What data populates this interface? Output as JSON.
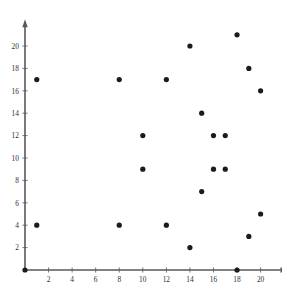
{
  "chart_data": {
    "type": "scatter",
    "title": "",
    "subtitle": "",
    "xlabel": "",
    "ylabel": "",
    "xlim": [
      0,
      22.2
    ],
    "ylim": [
      0,
      22.2
    ],
    "grid": false,
    "legend": null,
    "marker": {
      "shape": "circle",
      "color": "#1b1b1e",
      "radius_px": 2.6
    },
    "axis_color": "#58585a",
    "background_color": "#ffffff",
    "xticks": [
      2,
      4,
      6,
      8,
      10,
      12,
      14,
      16,
      18,
      20
    ],
    "yticks": [
      2,
      4,
      6,
      8,
      10,
      12,
      14,
      16,
      18,
      20
    ],
    "xtick_labels": [
      "2",
      "4",
      "6",
      "8",
      "10",
      "12",
      "14",
      "16",
      "18",
      "20"
    ],
    "ytick_labels": [
      "2",
      "4",
      "6",
      "8",
      "10",
      "12",
      "14",
      "16",
      "18",
      "20"
    ],
    "x": [
      0,
      1,
      1,
      8,
      8,
      10,
      10,
      12,
      12,
      14,
      14,
      15,
      15,
      16,
      16,
      17,
      17,
      18,
      18,
      19,
      19,
      20,
      20
    ],
    "y": [
      0,
      17,
      4,
      17,
      4,
      12,
      9,
      17,
      4,
      20,
      2,
      14,
      7,
      12,
      9,
      12,
      9,
      21,
      0,
      18,
      3,
      16,
      5
    ],
    "points": [
      {
        "x": 0,
        "y": 0
      },
      {
        "x": 1,
        "y": 17
      },
      {
        "x": 1,
        "y": 4
      },
      {
        "x": 8,
        "y": 17
      },
      {
        "x": 8,
        "y": 4
      },
      {
        "x": 10,
        "y": 12
      },
      {
        "x": 10,
        "y": 9
      },
      {
        "x": 12,
        "y": 17
      },
      {
        "x": 12,
        "y": 4
      },
      {
        "x": 14,
        "y": 20
      },
      {
        "x": 14,
        "y": 2
      },
      {
        "x": 15,
        "y": 14
      },
      {
        "x": 15,
        "y": 7
      },
      {
        "x": 16,
        "y": 12
      },
      {
        "x": 16,
        "y": 9
      },
      {
        "x": 17,
        "y": 12
      },
      {
        "x": 17,
        "y": 9
      },
      {
        "x": 18,
        "y": 21
      },
      {
        "x": 18,
        "y": 0
      },
      {
        "x": 19,
        "y": 18
      },
      {
        "x": 19,
        "y": 3
      },
      {
        "x": 20,
        "y": 16
      },
      {
        "x": 20,
        "y": 5
      }
    ],
    "n_points": 23
  }
}
